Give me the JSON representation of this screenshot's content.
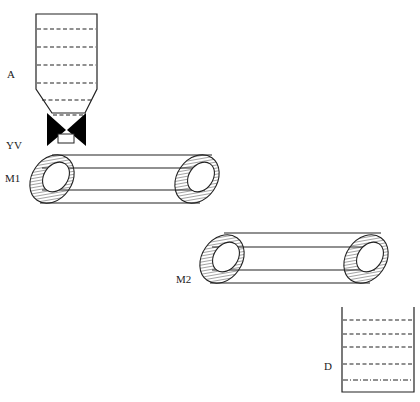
{
  "diagram": {
    "type": "process-schematic",
    "colors": {
      "stroke": "#222222",
      "fill": "#000000",
      "background": "#ffffff"
    }
  },
  "labels": {
    "hopper": "A",
    "valve": "YV",
    "conveyor1": "M1",
    "conveyor2": "M2",
    "tank": "D"
  },
  "components": [
    {
      "id": "A",
      "kind": "hopper",
      "level_lines": 7,
      "line_style": "dashed"
    },
    {
      "id": "YV",
      "kind": "valve",
      "symbol": "bowtie"
    },
    {
      "id": "M1",
      "kind": "belt-conveyor",
      "rollers": 2
    },
    {
      "id": "M2",
      "kind": "belt-conveyor",
      "rollers": 2
    },
    {
      "id": "D",
      "kind": "tank",
      "level_lines": 5,
      "line_styles": [
        "dashed",
        "dashed",
        "dashed",
        "dashed",
        "dash-dot"
      ]
    }
  ]
}
